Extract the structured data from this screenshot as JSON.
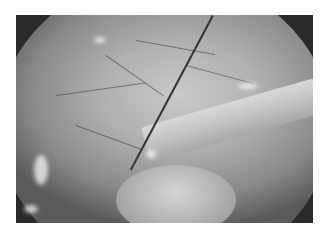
{
  "image": {
    "description": "Grayscale endoscopic view showing tissue surface with branching blood vessels, a thin wire crossing diagonally, and a cylindrical instrument entering from the right",
    "colors": {
      "background": "#ffffff",
      "vignette": "#2a2a2a",
      "tissue": "#b0b0b0",
      "instrument": "#c8c8c8",
      "wire": "#333333"
    }
  }
}
